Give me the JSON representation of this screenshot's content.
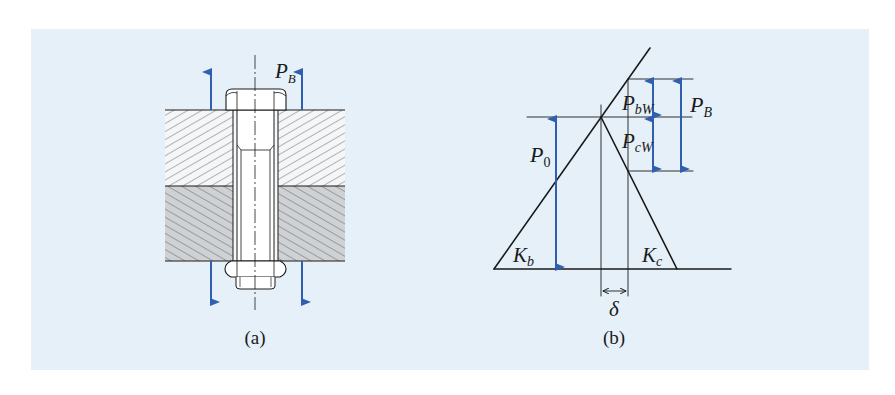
{
  "figure": {
    "background_color": "#e6f0f8",
    "arrow_color": "#2f5fae",
    "line_color": "#1a1a1a",
    "panel_a": {
      "caption": "(a)",
      "load_label_main": "P",
      "load_label_sub": "B",
      "description": "Bolted joint: two clamped plates with hex-head bolt and nut, external load arrows"
    },
    "panel_b": {
      "caption": "(b)",
      "labels": {
        "P0_main": "P",
        "P0_sub": "0",
        "PbW_main": "P",
        "PbW_sub": "bW",
        "PcW_main": "P",
        "PcW_sub": "cW",
        "PB_main": "P",
        "PB_sub": "B",
        "Kb_main": "K",
        "Kb_sub": "b",
        "Kc_main": "K",
        "Kc_sub": "c",
        "delta": "δ"
      },
      "description": "Force-deformation diagram of bolt (stiffness Kb) and clamped parts (stiffness Kc)"
    }
  }
}
